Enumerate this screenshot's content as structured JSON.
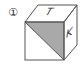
{
  "figure": {
    "number_label": "①",
    "face_labels": {
      "top": "T",
      "right": "K"
    },
    "shaded_color": "#a9a9a9",
    "edge_color": "#555555"
  }
}
